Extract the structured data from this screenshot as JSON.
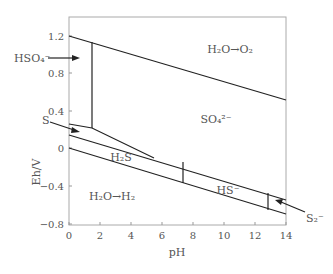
{
  "diagram": {
    "type": "pourbaix",
    "xlabel": "pH",
    "ylabel": "Eh/V",
    "x_ticks": [
      "0",
      "2",
      "4",
      "6",
      "8",
      "10",
      "12",
      "14"
    ],
    "y_ticks": [
      "1.2",
      "0.8",
      "0.4",
      "0",
      "−0.4",
      "−0.8"
    ],
    "regions": {
      "o2": "H₂O→O₂",
      "so4": "SO₄²⁻",
      "h2s": "H₂S",
      "hs": "HS⁻",
      "h2": "H₂O→H₂"
    },
    "callouts": {
      "hso4": "HSO₄⁻",
      "s": "S",
      "s2": "S₂⁻"
    }
  }
}
